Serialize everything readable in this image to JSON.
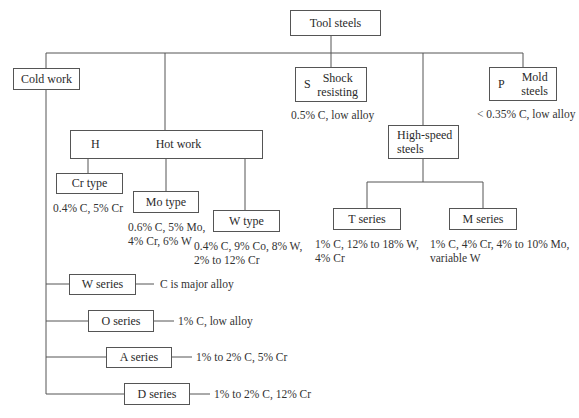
{
  "root": {
    "label": "Tool steels"
  },
  "categories": {
    "cold_work": {
      "label": "Cold work",
      "series": [
        {
          "label": "W series",
          "note": "C is major alloy"
        },
        {
          "label": "O series",
          "note": "1% C, low alloy"
        },
        {
          "label": "A series",
          "note": "1% to 2% C, 5% Cr"
        },
        {
          "label": "D series",
          "note": "1% to 2% C, 12% Cr"
        }
      ]
    },
    "hot_work": {
      "letter": "H",
      "label": "Hot work",
      "types": [
        {
          "label": "Cr type",
          "note_lines": [
            "0.4% C, 5% Cr"
          ]
        },
        {
          "label": "Mo type",
          "note_lines": [
            "0.6% C, 5% Mo,",
            "4% Cr, 6% W"
          ]
        },
        {
          "label": "W type",
          "note_lines": [
            "0.4% C, 9% Co, 8% W,",
            "2% to 12% Cr"
          ]
        }
      ]
    },
    "shock_resisting": {
      "letter": "S",
      "label_lines": [
        "Shock",
        "resisting"
      ],
      "note": "0.5% C, low alloy"
    },
    "high_speed": {
      "label_lines": [
        "High-speed",
        "steels"
      ],
      "series": [
        {
          "label": "T series",
          "note_lines": [
            "1% C, 12% to 18% W,",
            "4% Cr"
          ]
        },
        {
          "label": "M series",
          "note_lines": [
            "1% C, 4% Cr, 4% to 10% Mo,",
            "variable W"
          ]
        }
      ]
    },
    "mold": {
      "letter": "P",
      "label_lines": [
        "Mold",
        "steels"
      ],
      "note": "< 0.35% C, low alloy"
    }
  },
  "colors": {
    "line": "#555555",
    "text": "#2a2a2a",
    "background": "#ffffff"
  }
}
